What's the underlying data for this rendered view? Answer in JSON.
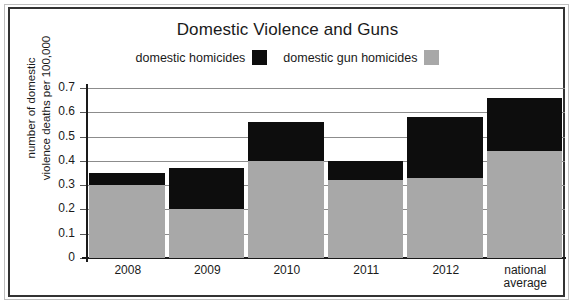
{
  "chart_data": {
    "type": "bar",
    "title": "Domestic Violence and Guns",
    "xlabel": "",
    "ylabel": "number of domestic violence deaths per 100,000",
    "ylabel_line1": "number of domestic",
    "ylabel_line2": "violence deaths per 100,000",
    "categories": [
      "2008",
      "2009",
      "2010",
      "2011",
      "2012",
      "national average"
    ],
    "category_lines": [
      [
        "2008"
      ],
      [
        "2009"
      ],
      [
        "2010"
      ],
      [
        "2011"
      ],
      [
        "2012"
      ],
      [
        "national",
        "average"
      ]
    ],
    "stacked": true,
    "series": [
      {
        "name": "domestic gun homicides",
        "color": "#a8a8a8",
        "values": [
          0.3,
          0.2,
          0.4,
          0.32,
          0.33,
          0.44
        ]
      },
      {
        "name": "domestic homicides",
        "color": "#0d0d0d",
        "values": [
          0.35,
          0.37,
          0.56,
          0.4,
          0.58,
          0.66
        ],
        "note": "total bar height (top of black segment)"
      }
    ],
    "ylim": [
      0,
      0.7
    ],
    "yticks": [
      0,
      0.1,
      0.2,
      0.3,
      0.4,
      0.5,
      0.6,
      0.7
    ],
    "ytick_labels": [
      "0",
      "0.1",
      "0.2",
      "0.3",
      "0.4",
      "0.5",
      "0.6",
      "0.7"
    ],
    "grid": true,
    "grid_color": "#8c8c8c",
    "legend_position": "top"
  },
  "legend": {
    "entries": [
      {
        "label": "domestic homicides",
        "color": "#0d0d0d",
        "swatch_name": "legend-swatch-domestic-homicides"
      },
      {
        "label": "domestic gun homicides",
        "color": "#a8a8a8",
        "swatch_name": "legend-swatch-domestic-gun-homicides"
      }
    ]
  },
  "colors": {
    "black_segment": "#0d0d0d",
    "gray_segment": "#a8a8a8",
    "axis": "#1a1a1a",
    "gridline": "#8c8c8c",
    "frame": "#333333",
    "background": "#ffffff"
  }
}
